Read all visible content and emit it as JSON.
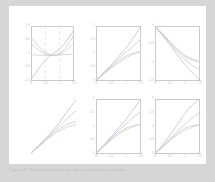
{
  "document": {
    "background_color": "#d6d6d8",
    "page_color": "#ffffff",
    "caption": "Figure 3: Estimated curves for the six simulation settings.",
    "axis_color": "#c9c9cf",
    "tick_label_color": "#bdbdc4"
  },
  "figure": {
    "rows": 2,
    "cols": 3,
    "panel_count": 6
  },
  "chart_data": [
    {
      "id": "panel-1",
      "type": "line",
      "title": "",
      "xlabel": "",
      "ylabel": "",
      "xlim": [
        0,
        1.5
      ],
      "ylim": [
        -1.0,
        1.0
      ],
      "xticks": [
        0,
        0.5,
        1,
        1.5
      ],
      "xticklabels": [
        "0",
        "0.5",
        "1",
        "1.5"
      ],
      "yticks": [
        -1.0,
        -0.5,
        0,
        0.5,
        1.0
      ],
      "yticklabels": [
        "-1.0",
        "-0.5",
        "0",
        "0.5",
        "1.0"
      ],
      "grid": true,
      "gridlines_x": [
        0.5,
        1.0
      ],
      "gridstyle": "dashed",
      "legend": "none",
      "series": [
        {
          "name": "curve-a",
          "color": "#c8bcd8",
          "x": [
            0,
            0.15,
            0.3,
            0.45,
            0.6,
            0.75,
            0.9,
            1.05,
            1.2,
            1.35,
            1.5
          ],
          "y": [
            -0.95,
            -0.72,
            -0.5,
            -0.3,
            -0.13,
            -0.02,
            0.08,
            0.22,
            0.4,
            0.62,
            0.85
          ]
        },
        {
          "name": "curve-b",
          "color": "#bdcfe0",
          "x": [
            0,
            0.15,
            0.3,
            0.45,
            0.6,
            0.75,
            0.9,
            1.05,
            1.2,
            1.35,
            1.5
          ],
          "y": [
            0.6,
            0.4,
            0.22,
            0.08,
            -0.02,
            -0.06,
            -0.04,
            0.04,
            0.2,
            0.42,
            0.66
          ]
        },
        {
          "name": "curve-c",
          "color": "#d8c6c0",
          "x": [
            0,
            0.15,
            0.3,
            0.45,
            0.6,
            0.75,
            0.9,
            1.05,
            1.2,
            1.35,
            1.5
          ],
          "y": [
            0.35,
            0.22,
            0.1,
            0.01,
            -0.05,
            -0.08,
            -0.06,
            0.0,
            0.1,
            0.22,
            0.36
          ]
        },
        {
          "name": "curve-d",
          "color": "#c6d6c8",
          "x": [
            0,
            0.3,
            0.6,
            0.9,
            1.2,
            1.5
          ],
          "y": [
            -0.05,
            -0.06,
            -0.07,
            -0.06,
            -0.04,
            -0.02
          ]
        }
      ]
    },
    {
      "id": "panel-2",
      "type": "line",
      "title": "",
      "xlabel": "",
      "ylabel": "",
      "xlim": [
        0,
        1.5
      ],
      "ylim": [
        0,
        2.0
      ],
      "xticks": [
        0,
        0.5,
        1,
        1.5
      ],
      "xticklabels": [
        "0",
        "0.5",
        "1",
        "1.5"
      ],
      "yticks": [
        0,
        0.5,
        1.0,
        1.5,
        2.0
      ],
      "yticklabels": [
        "0",
        "0.5",
        "1",
        "1.5",
        "2"
      ],
      "grid": false,
      "legend": "none",
      "series": [
        {
          "name": "curve-a",
          "color": "#c8bcd8",
          "x": [
            0,
            0.25,
            0.5,
            0.75,
            1.0,
            1.15,
            1.3,
            1.4,
            1.5
          ],
          "y": [
            0.02,
            0.3,
            0.58,
            0.88,
            1.2,
            1.42,
            1.66,
            1.84,
            2.0
          ]
        },
        {
          "name": "curve-b",
          "color": "#bdcfe0",
          "x": [
            0,
            0.25,
            0.5,
            0.75,
            1.0,
            1.15,
            1.3,
            1.4,
            1.5
          ],
          "y": [
            0.02,
            0.28,
            0.54,
            0.8,
            1.04,
            1.18,
            1.32,
            1.42,
            1.52
          ]
        },
        {
          "name": "curve-c",
          "color": "#d8c6c0",
          "x": [
            0,
            0.25,
            0.5,
            0.75,
            1.0,
            1.15,
            1.3,
            1.4,
            1.5
          ],
          "y": [
            0.02,
            0.26,
            0.5,
            0.72,
            0.9,
            0.98,
            1.03,
            1.05,
            1.06
          ]
        },
        {
          "name": "curve-d",
          "color": "#c6d6c8",
          "x": [
            0,
            0.25,
            0.5,
            0.75,
            1.0,
            1.25,
            1.5
          ],
          "y": [
            0.02,
            0.24,
            0.46,
            0.66,
            0.84,
            0.98,
            1.08
          ]
        }
      ]
    },
    {
      "id": "panel-3",
      "type": "line",
      "title": "",
      "xlabel": "",
      "ylabel": "",
      "xlim": [
        0,
        1.5
      ],
      "ylim": [
        -1.5,
        0
      ],
      "xticks": [
        0,
        0.5,
        1,
        1.5
      ],
      "xticklabels": [
        "0",
        "0.5",
        "1",
        "1.5"
      ],
      "yticks": [
        -1.5,
        -1.0,
        -0.5,
        0
      ],
      "yticklabels": [
        "-1.5",
        "-1",
        "-0.5",
        "0"
      ],
      "grid": false,
      "legend": "none",
      "series": [
        {
          "name": "curve-a",
          "color": "#c8bcd8",
          "x": [
            0,
            0.25,
            0.5,
            0.75,
            1.0,
            1.25,
            1.5
          ],
          "y": [
            -0.02,
            -0.26,
            -0.52,
            -0.8,
            -1.05,
            -1.28,
            -1.48
          ]
        },
        {
          "name": "curve-b",
          "color": "#bdcfe0",
          "x": [
            0,
            0.25,
            0.5,
            0.75,
            1.0,
            1.25,
            1.5
          ],
          "y": [
            -0.02,
            -0.24,
            -0.48,
            -0.72,
            -0.92,
            -1.08,
            -1.2
          ]
        },
        {
          "name": "curve-c",
          "color": "#d8c6c0",
          "x": [
            0,
            0.25,
            0.5,
            0.75,
            1.0,
            1.25,
            1.5
          ],
          "y": [
            -0.02,
            -0.22,
            -0.44,
            -0.66,
            -0.84,
            -0.94,
            -0.99
          ]
        },
        {
          "name": "curve-d",
          "color": "#c6d6c8",
          "x": [
            0,
            0.25,
            0.5,
            0.75,
            1.0,
            1.25,
            1.5
          ],
          "y": [
            -0.02,
            -0.2,
            -0.42,
            -0.63,
            -0.8,
            -0.9,
            -0.96
          ]
        }
      ]
    },
    {
      "id": "panel-4",
      "type": "line",
      "title": "",
      "xlabel": "",
      "ylabel": "",
      "xlim": [
        0,
        1.5
      ],
      "ylim": [
        0,
        2.0
      ],
      "xticks": [],
      "xticklabels": [],
      "yticks": [],
      "yticklabels": [],
      "grid": false,
      "axes_visible": false,
      "legend": "none",
      "series": [
        {
          "name": "curve-a",
          "color": "#c8bcd8",
          "x": [
            0,
            0.3,
            0.6,
            0.9,
            1.1,
            1.3,
            1.45,
            1.5
          ],
          "y": [
            0.03,
            0.36,
            0.7,
            1.08,
            1.38,
            1.68,
            1.9,
            1.98
          ]
        },
        {
          "name": "curve-b",
          "color": "#bdcfe0",
          "x": [
            0,
            0.3,
            0.6,
            0.9,
            1.1,
            1.3,
            1.45,
            1.5
          ],
          "y": [
            0.03,
            0.34,
            0.66,
            0.98,
            1.18,
            1.38,
            1.52,
            1.56
          ]
        },
        {
          "name": "curve-c",
          "color": "#d8c6c0",
          "x": [
            0,
            0.3,
            0.6,
            0.9,
            1.1,
            1.3,
            1.45,
            1.5
          ],
          "y": [
            0.03,
            0.32,
            0.62,
            0.88,
            1.02,
            1.12,
            1.17,
            1.18
          ]
        },
        {
          "name": "curve-d",
          "color": "#c6d6c8",
          "x": [
            0,
            0.3,
            0.6,
            0.9,
            1.2,
            1.5
          ],
          "y": [
            0.03,
            0.3,
            0.58,
            0.82,
            0.98,
            1.06
          ]
        }
      ]
    },
    {
      "id": "panel-5",
      "type": "line",
      "title": "",
      "xlabel": "",
      "ylabel": "",
      "xlim": [
        0,
        1.5
      ],
      "ylim": [
        0,
        2.0
      ],
      "xticks": [
        0,
        0.5,
        1,
        1.5
      ],
      "xticklabels": [
        "0",
        "0.5",
        "1",
        "1.5"
      ],
      "yticks": [
        0,
        0.5,
        1.0,
        1.5,
        2.0
      ],
      "yticklabels": [
        "0",
        "0.5",
        "1",
        "1.5",
        "2"
      ],
      "grid": false,
      "legend": "none",
      "series": [
        {
          "name": "curve-a",
          "color": "#c8bcd8",
          "x": [
            0,
            0.25,
            0.5,
            0.75,
            1.0,
            1.15,
            1.3,
            1.4,
            1.5
          ],
          "y": [
            0.02,
            0.32,
            0.62,
            0.94,
            1.26,
            1.48,
            1.7,
            1.86,
            2.0
          ]
        },
        {
          "name": "curve-b",
          "color": "#bdcfe0",
          "x": [
            0,
            0.25,
            0.5,
            0.75,
            1.0,
            1.15,
            1.3,
            1.4,
            1.5
          ],
          "y": [
            0.02,
            0.3,
            0.58,
            0.86,
            1.1,
            1.24,
            1.38,
            1.46,
            1.54
          ]
        },
        {
          "name": "curve-c",
          "color": "#d8c6c0",
          "x": [
            0,
            0.25,
            0.5,
            0.75,
            1.0,
            1.15,
            1.3,
            1.4,
            1.5
          ],
          "y": [
            0.02,
            0.28,
            0.54,
            0.78,
            0.94,
            1.0,
            1.04,
            1.06,
            1.07
          ]
        },
        {
          "name": "curve-d",
          "color": "#c6d6c8",
          "x": [
            0,
            0.25,
            0.5,
            0.75,
            1.0,
            1.25,
            1.5
          ],
          "y": [
            0.02,
            0.26,
            0.5,
            0.72,
            0.88,
            1.0,
            1.08
          ]
        }
      ]
    },
    {
      "id": "panel-6",
      "type": "line",
      "title": "",
      "xlabel": "",
      "ylabel": "",
      "xlim": [
        0,
        1.5
      ],
      "ylim": [
        0,
        2.0
      ],
      "xticks": [
        0,
        0.5,
        1,
        1.5
      ],
      "xticklabels": [
        "0",
        "0.5",
        "1",
        "1.5"
      ],
      "yticks": [
        0,
        0.5,
        1.0,
        1.5,
        2.0
      ],
      "yticklabels": [
        "0",
        "0.5",
        "1",
        "1.5",
        "2"
      ],
      "grid": false,
      "legend": "none",
      "series": [
        {
          "name": "curve-a",
          "color": "#c8bcd8",
          "x": [
            0,
            0.2,
            0.4,
            0.6,
            0.8,
            0.95,
            1.1,
            1.25,
            1.4,
            1.5
          ],
          "y": [
            0.02,
            0.26,
            0.54,
            0.84,
            1.16,
            1.4,
            1.62,
            1.8,
            1.94,
            2.0
          ]
        },
        {
          "name": "curve-b",
          "color": "#bdcfe0",
          "x": [
            0,
            0.25,
            0.5,
            0.75,
            1.0,
            1.15,
            1.3,
            1.4,
            1.5
          ],
          "y": [
            0.02,
            0.28,
            0.56,
            0.84,
            1.08,
            1.22,
            1.36,
            1.44,
            1.52
          ]
        },
        {
          "name": "curve-c",
          "color": "#d8c6c0",
          "x": [
            0,
            0.25,
            0.5,
            0.75,
            1.0,
            1.15,
            1.3,
            1.4,
            1.5
          ],
          "y": [
            0.02,
            0.26,
            0.52,
            0.76,
            0.94,
            1.0,
            1.04,
            1.06,
            1.07
          ]
        },
        {
          "name": "curve-d",
          "color": "#c6d6c8",
          "x": [
            0,
            0.25,
            0.5,
            0.75,
            1.0,
            1.25,
            1.5
          ],
          "y": [
            0.02,
            0.24,
            0.48,
            0.7,
            0.86,
            0.98,
            1.06
          ]
        }
      ]
    }
  ]
}
